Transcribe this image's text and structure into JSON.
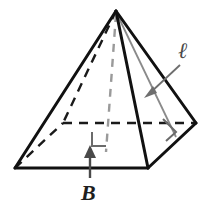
{
  "figure": {
    "name": "square-pyramid-diagram",
    "colors": {
      "outline": "#111111",
      "hidden_edge": "#1a1a1a",
      "base_fill": "#d9d9d9",
      "slant_line": "#8a8a8a",
      "arrow": "#6e6e6e",
      "label_text": "#2b2b2b",
      "background": "#ffffff"
    },
    "labels": {
      "slant_height": "ℓ",
      "base_area": "B"
    },
    "geometry": {
      "apex": [
        116,
        11
      ],
      "vertex_left": [
        15,
        168
      ],
      "vertex_front": [
        148,
        168
      ],
      "vertex_right": [
        196,
        123
      ],
      "vertex_back_hidden": [
        63,
        123
      ],
      "base_center": [
        106,
        137
      ],
      "slant_foot": [
        176,
        136
      ]
    },
    "annotations": {
      "right_angle_center": "right-angle-marker-at-base-center",
      "right_angle_slant": "right-angle-marker-at-slant-foot",
      "arrow_slant": "arrow-pointing-to-slant-height-line",
      "arrow_base": "arrow-pointing-to-base-face"
    }
  }
}
